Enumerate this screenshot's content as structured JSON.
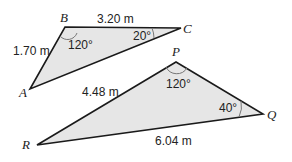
{
  "colors": {
    "fill": "#e6e6e6",
    "stroke": "#1a1a1a",
    "arc": "#666666"
  },
  "triangle_abc": {
    "vertices": {
      "A": "A",
      "B": "B",
      "C": "C"
    },
    "side_ab": "1.70 m",
    "side_bc": "3.20 m",
    "angle_b": "120°",
    "angle_c": "20°"
  },
  "triangle_pqr": {
    "vertices": {
      "P": "P",
      "Q": "Q",
      "R": "R"
    },
    "side_pr": "4.48 m",
    "side_rq": "6.04 m",
    "angle_p": "120°",
    "angle_q": "40°"
  }
}
